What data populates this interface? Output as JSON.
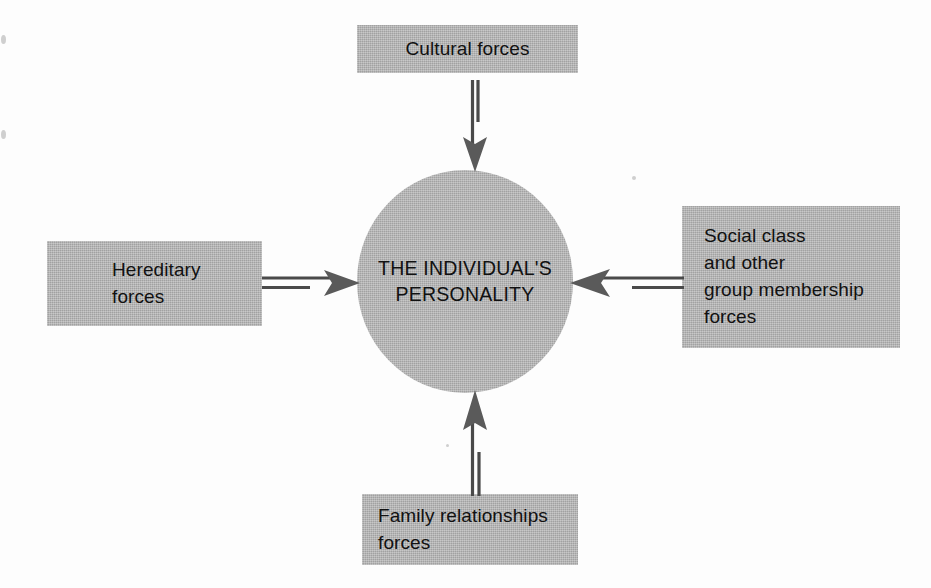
{
  "diagram": {
    "center": {
      "id": "central-node",
      "text": "THE INDIVIDUAL'S\nPERSONALITY",
      "shape": "ellipse",
      "fill": "#b3b3b3"
    },
    "nodes": [
      {
        "id": "cultural-forces",
        "text": "Cultural forces",
        "position": "top",
        "align": "center",
        "fill": "#b3b3b3"
      },
      {
        "id": "hereditary-forces",
        "text": "Hereditary\nforces",
        "position": "left",
        "align": "left",
        "fill": "#b3b3b3"
      },
      {
        "id": "social-class-forces",
        "text": "Social class\nand other\ngroup membership\nforces",
        "position": "right",
        "align": "left",
        "fill": "#b3b3b3"
      },
      {
        "id": "family-relationships-forces",
        "text": "Family relationships\nforces",
        "position": "bottom",
        "align": "left",
        "fill": "#b3b3b3"
      }
    ],
    "arrows": [
      {
        "id": "arrow-top",
        "from": "cultural-forces",
        "to": "central-node",
        "direction": "down",
        "style": "double-line-barbed"
      },
      {
        "id": "arrow-left",
        "from": "hereditary-forces",
        "to": "central-node",
        "direction": "right",
        "style": "double-line-barbed"
      },
      {
        "id": "arrow-right",
        "from": "social-class-forces",
        "to": "central-node",
        "direction": "left",
        "style": "double-line-barbed"
      },
      {
        "id": "arrow-bottom",
        "from": "family-relationships-forces",
        "to": "central-node",
        "direction": "up",
        "style": "double-line-barbed"
      }
    ],
    "colors": {
      "shape_fill": "#b3b3b3",
      "arrow_stroke": "#4a4a4a",
      "arrow_head": "#5a5a5a",
      "text": "#111111",
      "background": "#fdfdfd"
    }
  }
}
